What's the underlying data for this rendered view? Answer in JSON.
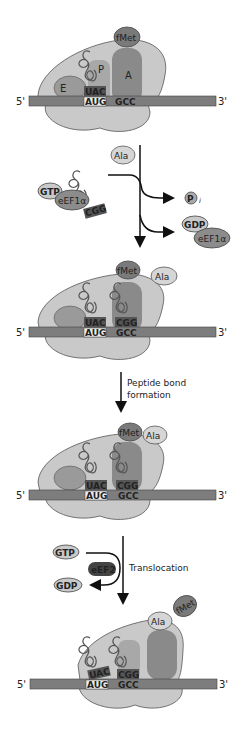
{
  "diagram": {
    "title": "",
    "colors": {
      "ribosome_light": "#c9c9c9",
      "ribosome_mid": "#a8a8a8",
      "site_dark": "#8a8a8a",
      "mrna": "#7d7d7d",
      "trna": "#bdbdbd",
      "amino_light": "#d6d6d6",
      "amino_dark": "#7a7a7a",
      "factor": "#8c8c8c",
      "eef2": "#444444",
      "arrow": "#111111"
    },
    "stages": [
      {
        "id": "initial",
        "mrna": {
          "five_prime": "5'",
          "three_prime": "3'"
        },
        "codons": [
          "AUG",
          "GCC"
        ],
        "anticodons": [
          "UAC"
        ],
        "sites": {
          "E": "E",
          "P": "P",
          "A": "A"
        },
        "amino_acids": [
          "fMet"
        ]
      },
      {
        "id": "aminoacyl-tRNA-delivery",
        "ternary_complex": {
          "gtp": "GTP",
          "factor": "eEF1α",
          "amino_acid": "Ala",
          "anticodon": "CGG"
        },
        "products": {
          "pi_symbol": "P",
          "pi_subscript": "i",
          "gdp": "GDP",
          "factor": "eEF1α"
        }
      },
      {
        "id": "after-delivery",
        "mrna": {
          "five_prime": "5'",
          "three_prime": "3'"
        },
        "codons": [
          "AUG",
          "GCC"
        ],
        "anticodons": [
          "UAC",
          "CGG"
        ],
        "amino_acids": [
          "fMet",
          "Ala"
        ]
      },
      {
        "id": "after-peptide-bond",
        "step_label_line1": "Peptide bond",
        "step_label_line2": "formation",
        "mrna": {
          "five_prime": "5'",
          "three_prime": "3'"
        },
        "codons": [
          "AUG",
          "GCC"
        ],
        "anticodons": [
          "UAC",
          "CGG"
        ],
        "amino_acids": [
          "fMet",
          "Ala"
        ]
      },
      {
        "id": "after-translocation",
        "step_label": "Translocation",
        "factor_inputs": {
          "gtp": "GTP",
          "factor": "eEF2",
          "gdp": "GDP"
        },
        "mrna": {
          "five_prime": "5'",
          "three_prime": "3'"
        },
        "codons": [
          "AUG",
          "GCC"
        ],
        "anticodons": [
          "UAC",
          "CGG"
        ],
        "amino_acids": [
          "Ala",
          "fMet"
        ]
      }
    ]
  }
}
